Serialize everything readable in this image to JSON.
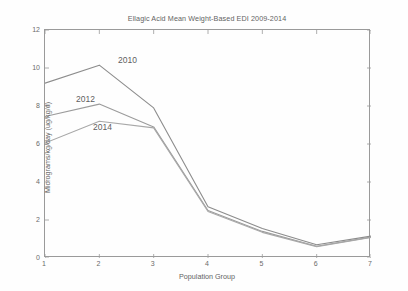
{
  "chart_data": {
    "type": "line",
    "title": "Ellagic Acid Mean Weight-Based EDI 2009-2014",
    "xlabel": "Population Group",
    "ylabel": "Micrograms/kg/day (ug/kg/d)",
    "x": [
      1,
      2,
      3,
      4,
      5,
      6,
      7
    ],
    "xticklabels": [
      "1",
      "2",
      "3",
      "4",
      "5",
      "6",
      "7"
    ],
    "yticklabels": [
      "0",
      "2",
      "4",
      "6",
      "8",
      "10",
      "12"
    ],
    "xlim": [
      1,
      7
    ],
    "ylim": [
      0,
      12
    ],
    "ytick_step": 2,
    "grid": false,
    "legend_position": "inline-annotations",
    "series": [
      {
        "name": "2010",
        "color": "#8c8c8c",
        "values": [
          9.2,
          10.15,
          7.9,
          2.7,
          1.55,
          0.7,
          1.15
        ],
        "annotation": {
          "label": "2010",
          "x_px": 118,
          "y_px": 55
        }
      },
      {
        "name": "2012",
        "color": "#9b9b9b",
        "values": [
          7.45,
          8.1,
          6.9,
          2.5,
          1.4,
          0.62,
          1.1
        ],
        "annotation": {
          "label": "2012",
          "x_px": 76,
          "y_px": 94
        }
      },
      {
        "name": "2014",
        "color": "#a8a8a8",
        "values": [
          6.05,
          7.2,
          6.85,
          2.45,
          1.35,
          0.6,
          1.08
        ],
        "annotation": {
          "label": "2014",
          "x_px": 93,
          "y_px": 122
        }
      }
    ]
  },
  "ghost": {
    "lines": [
      "Conclusions",
      "the results of this study"
    ]
  }
}
